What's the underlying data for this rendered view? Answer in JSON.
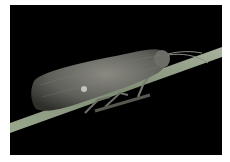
{
  "image": {
    "subject": "moth resting on plant stem",
    "background_color": "#000000",
    "border_color": "#ffffff",
    "description": "Grey-brown moth with folded wings perched on a diagonal pale green stem against a black background"
  }
}
